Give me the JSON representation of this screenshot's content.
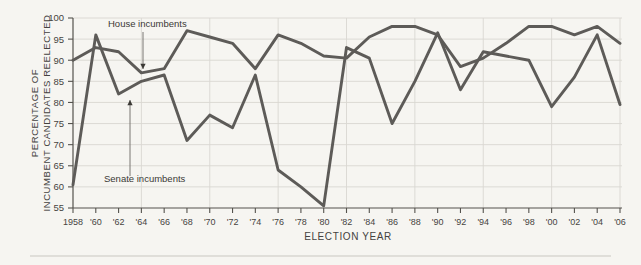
{
  "chart_data": {
    "type": "line",
    "title": "",
    "xlabel": "ELECTION YEAR",
    "ylabel": "PERCENTAGE OF INCUMBENT CANDIDATES REELECTED",
    "x": [
      1958,
      1960,
      1962,
      1964,
      1966,
      1968,
      1970,
      1972,
      1974,
      1976,
      1978,
      1980,
      1982,
      1984,
      1986,
      1988,
      1990,
      1992,
      1994,
      1996,
      1998,
      2000,
      2002,
      2004,
      2006
    ],
    "xtick_labels": [
      "1958",
      "'60",
      "'62",
      "'64",
      "'66",
      "'68",
      "'70",
      "'72",
      "'74",
      "'76",
      "'78",
      "'80",
      "'82",
      "'84",
      "'86",
      "'88",
      "'90",
      "'92",
      "'94",
      "'96",
      "'98",
      "'00",
      "'02",
      "'04",
      "'06"
    ],
    "ytick_labels": [
      "100",
      "95",
      "90",
      "85",
      "80",
      "75",
      "70",
      "65",
      "60",
      "55"
    ],
    "ytick_values": [
      100,
      95,
      90,
      85,
      80,
      75,
      70,
      65,
      60,
      55
    ],
    "ylim": [
      55,
      100
    ],
    "xlim": [
      1958,
      2006
    ],
    "grid": true,
    "legend_position": "inline-annotations",
    "series": [
      {
        "name": "House incumbents",
        "color": "#5d5b58",
        "values": [
          90.0,
          93.0,
          92.0,
          87.0,
          88.0,
          97.0,
          95.5,
          94.0,
          88.0,
          96.0,
          94.0,
          91.0,
          90.5,
          95.5,
          98.0,
          98.0,
          96.0,
          88.5,
          90.5,
          94.0,
          98.0,
          98.0,
          96.0,
          98.0,
          94.0
        ]
      },
      {
        "name": "Senate incumbents",
        "color": "#5d5b58",
        "values": [
          60.5,
          96.0,
          82.0,
          85.0,
          86.5,
          71.0,
          77.0,
          74.0,
          86.5,
          64.0,
          60.0,
          55.5,
          93.0,
          90.5,
          75.0,
          85.0,
          96.5,
          83.0,
          92.0,
          91.0,
          90.0,
          79.0,
          86.0,
          96.0,
          79.5
        ]
      }
    ],
    "annotations": [
      {
        "text": "House incumbents",
        "target_year": 1964,
        "target_value": 87.0,
        "label_x": 108,
        "label_y": 27,
        "arrow_x": 143,
        "arrow_y_start": 32,
        "arrow_y_end": 69
      },
      {
        "text": "Senate incumbents",
        "target_year": 1962,
        "target_value": 82.0,
        "label_x": 104,
        "label_y": 182,
        "arrow_x": 130,
        "arrow_y_start": 176,
        "arrow_y_end": 100
      }
    ]
  },
  "figure": {
    "background_color": "#f6f5f1",
    "line_color": "#5d5b58",
    "grid_color": "#d9d7d1",
    "axis_color": "#55534e",
    "text_color": "#46443f"
  }
}
